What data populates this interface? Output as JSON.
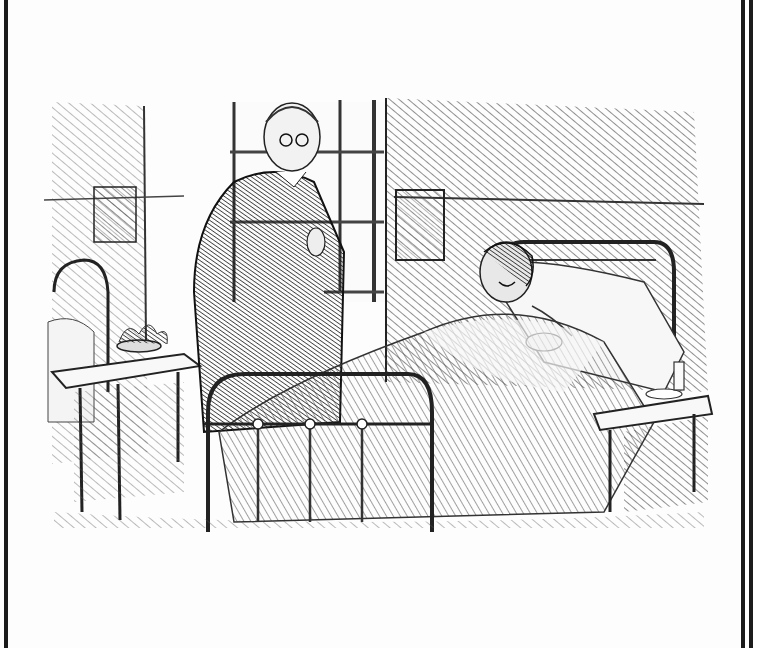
{
  "page": {
    "type": "scanned-book-page",
    "background": "#fdfdfd",
    "ink_color": "#1a1a1a",
    "borders": {
      "left": "single-rule",
      "right": "double-rule"
    }
  },
  "illustration": {
    "description": "Pen-and-ink illustration: an elderly clergyman in a dark coat with spectacles stands beside a hospital bed, speaking to a smiling male patient lying propped on pillows. Hospital ward with window, framed notices on wall, iron bedsteads, bedside tables with a bowl of flowers and a glass on a saucer.",
    "figures": [
      {
        "name": "clergyman",
        "description": "Elderly bald man with spectacles, dark frock coat, hand at collar"
      },
      {
        "name": "patient",
        "description": "Dark-haired man in bed, smiling, hands on blanket"
      }
    ],
    "objects": [
      "window",
      "framed-notice-left",
      "framed-notice-right",
      "iron-bed-foreground",
      "iron-bed-left",
      "bedside-table-left",
      "flower-bowl",
      "bedside-table-right",
      "drinking-glass",
      "saucer"
    ]
  },
  "caption": {
    "text": ""
  }
}
